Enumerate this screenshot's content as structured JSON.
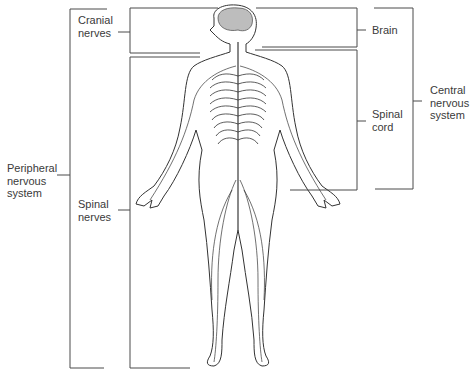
{
  "diagram": {
    "labels": {
      "cranial_nerves": "Cranial\nnerves",
      "brain": "Brain",
      "spinal_cord": "Spinal\ncord",
      "central_nervous_system": "Central\nnervous\nsystem",
      "peripheral_nervous_system": "Peripheral\nnervous\nsystem",
      "spinal_nerves": "Spinal\nnerves"
    },
    "colors": {
      "line": "#4a4a4a",
      "brain_fill": "#bdbdbd",
      "text": "#3a3a3a"
    }
  }
}
